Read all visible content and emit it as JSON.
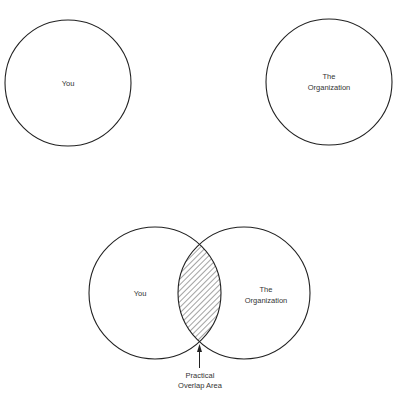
{
  "diagram": {
    "top": {
      "left_circle": {
        "label": "You",
        "cx": 68,
        "cy": 83,
        "r": 63
      },
      "right_circle": {
        "label_line1": "The",
        "label_line2": "Organization",
        "cx": 329,
        "cy": 82,
        "r": 63
      }
    },
    "bottom": {
      "left_circle": {
        "label": "You",
        "cx": 155,
        "cy": 293,
        "r": 66
      },
      "right_circle": {
        "label_line1": "The",
        "label_line2": "Organization",
        "cx": 244,
        "cy": 293,
        "r": 66
      },
      "overlap": {
        "label_line1": "Practical",
        "label_line2": "Overlap Area",
        "fill_pattern": "diagonal-hatch"
      }
    },
    "colors": {
      "stroke": "#222222",
      "background": "#ffffff",
      "text": "#333333"
    }
  }
}
